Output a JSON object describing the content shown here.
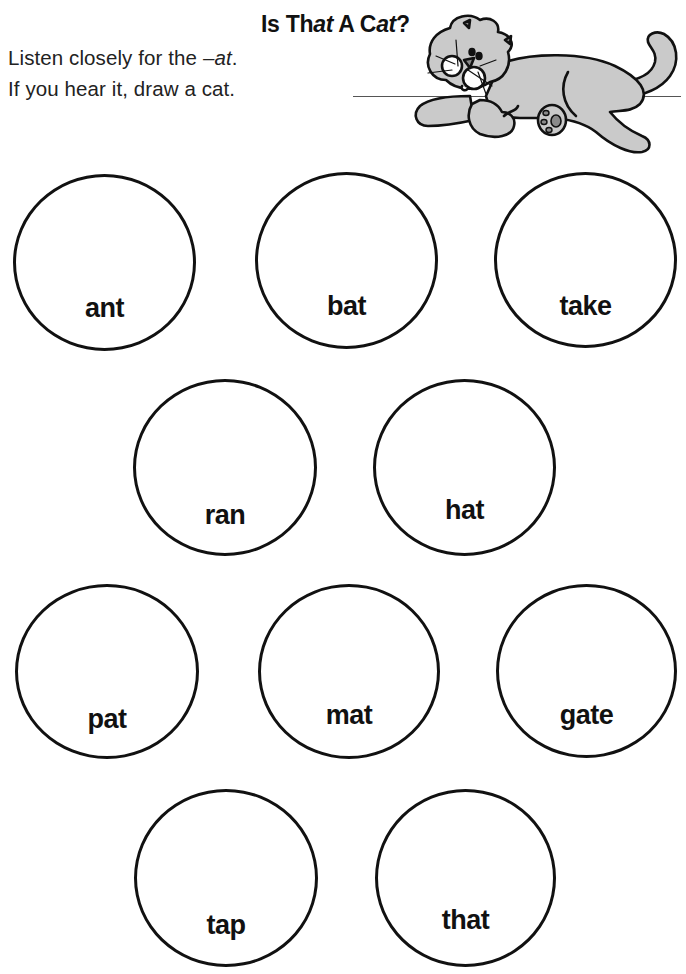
{
  "worksheet": {
    "title": {
      "parts": [
        {
          "text": "Is Th",
          "italic": false
        },
        {
          "text": "at",
          "italic": true
        },
        {
          "text": " A C",
          "italic": false
        },
        {
          "text": "at",
          "italic": true
        },
        {
          "text": "?",
          "italic": false
        }
      ],
      "full": "Is That A Cat?"
    },
    "instructions": {
      "line1_prefix": "Listen closely for the ",
      "line1_italic": "–at",
      "line1_suffix": ".",
      "line2": "If you hear it, draw a cat."
    },
    "illustration": "cat-illustration",
    "circles": [
      {
        "word": "ant",
        "row": 1
      },
      {
        "word": "bat",
        "row": 1
      },
      {
        "word": "take",
        "row": 1
      },
      {
        "word": "ran",
        "row": 2
      },
      {
        "word": "hat",
        "row": 2
      },
      {
        "word": "pat",
        "row": 3
      },
      {
        "word": "mat",
        "row": 3
      },
      {
        "word": "gate",
        "row": 3
      },
      {
        "word": "tap",
        "row": 4
      },
      {
        "word": "that",
        "row": 4
      }
    ]
  },
  "colors": {
    "ink": "#111111",
    "cat_fill": "#cacaca",
    "paw_pad": "#8a8a8a",
    "background": "#ffffff"
  }
}
